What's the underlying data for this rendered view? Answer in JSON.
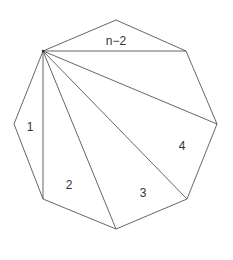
{
  "diagram": {
    "title": "",
    "shape": "octagon fan triangulation",
    "vertices": {
      "apex": [
        43,
        51
      ],
      "top": [
        116,
        20
      ],
      "upper_right": [
        186,
        51
      ],
      "right": [
        217,
        124
      ],
      "lower_right": [
        187,
        199
      ],
      "bottom": [
        116,
        229
      ],
      "lower_left": [
        43,
        199
      ],
      "left": [
        14,
        124
      ]
    },
    "labels": [
      {
        "text": "1",
        "x": 30,
        "y": 131
      },
      {
        "text": "2",
        "x": 69,
        "y": 189
      },
      {
        "text": "3",
        "x": 143,
        "y": 197
      },
      {
        "text": "4",
        "x": 182,
        "y": 150
      },
      {
        "text": "n−2",
        "x": 116,
        "y": 45
      }
    ],
    "colors": {
      "stroke": "#555555",
      "text": "#333333",
      "background": "#ffffff"
    }
  }
}
